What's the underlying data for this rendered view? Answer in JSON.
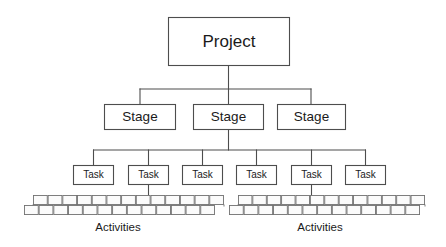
{
  "diagram": {
    "type": "work-breakdown-structure",
    "title": "",
    "canvas": {
      "width": 446,
      "height": 247,
      "background": "#ffffff"
    },
    "colors": {
      "box_stroke": "#4d4d4d",
      "box_fill": "#ffffff",
      "cell_stroke": "#717171",
      "cell_fill": "#fbfbfb",
      "connector": "#4d4d4d",
      "text": "#1a1a1a"
    },
    "levels": [
      {
        "level": 1,
        "name": "project-level",
        "nodes": [
          {
            "label": "Project",
            "x": 168,
            "y": 17,
            "w": 122,
            "h": 49
          }
        ]
      },
      {
        "level": 2,
        "name": "stage-level",
        "nodes": [
          {
            "label": "Stage",
            "x": 104,
            "y": 104,
            "w": 72,
            "h": 26
          },
          {
            "label": "Stage",
            "x": 191,
            "y": 104,
            "w": 71,
            "h": 26
          },
          {
            "label": "Stage",
            "x": 277,
            "y": 104,
            "w": 69,
            "h": 26
          }
        ]
      },
      {
        "level": 3,
        "name": "task-level",
        "nodes": [
          {
            "label": "Task",
            "x": 73,
            "y": 165,
            "w": 41,
            "h": 20
          },
          {
            "label": "Task",
            "x": 128,
            "y": 165,
            "w": 41,
            "h": 20
          },
          {
            "label": "Task",
            "x": 182,
            "y": 165,
            "w": 41,
            "h": 20
          },
          {
            "label": "Task",
            "x": 236,
            "y": 165,
            "w": 41,
            "h": 20
          },
          {
            "label": "Task",
            "x": 291,
            "y": 165,
            "w": 41,
            "h": 20
          },
          {
            "label": "Task",
            "x": 345,
            "y": 165,
            "w": 41,
            "h": 20
          }
        ]
      },
      {
        "level": 4,
        "name": "activity-level",
        "groups": [
          {
            "caption": "Activities",
            "caption_x": 118,
            "caption_y": 228,
            "parent_task_index": 1,
            "upper_row": {
              "x": 33,
              "y": 195,
              "w": 191,
              "h": 10,
              "cells": 13
            },
            "lower_row": {
              "x": 24,
              "y": 205,
              "w": 191,
              "h": 10,
              "cells": 13
            }
          },
          {
            "caption": "Activities",
            "caption_x": 320,
            "caption_y": 228,
            "parent_task_index": 4,
            "upper_row": {
              "x": 238,
              "y": 195,
              "w": 187,
              "h": 10,
              "cells": 13
            },
            "lower_row": {
              "x": 229,
              "y": 205,
              "w": 191,
              "h": 10,
              "cells": 13
            }
          }
        ]
      }
    ],
    "connections": [
      {
        "from": "Project",
        "to": "Stage bus",
        "kind": "vertical-then-bus"
      },
      {
        "from": "Stage 2",
        "to": "Task bus",
        "kind": "vertical-then-bus"
      },
      {
        "from": "Task 2",
        "to": "Activities group 1",
        "kind": "vertical"
      },
      {
        "from": "Task 5",
        "to": "Activities group 2",
        "kind": "vertical"
      }
    ]
  }
}
